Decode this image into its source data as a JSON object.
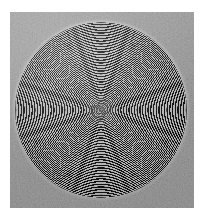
{
  "figure": {
    "kind": "scanned-halftone-plate",
    "caption": "",
    "label": ""
  },
  "canvas": {
    "width_px": 203,
    "height_px": 218,
    "background_color": "#ffffff"
  },
  "plate": {
    "left_px": 10,
    "top_px": 12,
    "width_px": 184,
    "height_px": 196,
    "paper_color": "#9b9b9b",
    "texture": "grain-noise"
  },
  "disc": {
    "center_x_px": 101,
    "center_y_px": 110,
    "radius_x_px": 86,
    "radius_y_px": 88,
    "ring_period_px": 1.58,
    "ring_dark_color": "#121212",
    "ring_light_color": "#b9b9b9",
    "fill_color": "#8e8e8e",
    "rim_highlight_color": "#ffffff",
    "nucleus_type": "spiral"
  },
  "chart_data": {
    "type": "scatter",
    "title": "",
    "subtitle": "",
    "xlabel": "",
    "ylabel": "",
    "grid": false,
    "legend": "none",
    "annotations": [],
    "tick_labels_x": [],
    "tick_labels_y": [],
    "series": [
      {
        "name": "concentric rings",
        "geometry": "circle",
        "center": [
          101,
          110
        ],
        "radii_px": [
          2,
          4,
          5,
          7,
          9,
          10,
          12,
          14,
          15,
          17,
          19,
          20,
          22,
          24,
          25,
          27,
          28,
          30,
          32,
          33,
          35,
          37,
          38,
          40,
          42,
          43,
          45,
          47,
          48,
          50,
          51,
          53,
          55,
          56,
          58,
          60,
          61,
          63,
          65,
          66,
          68,
          70,
          71,
          73,
          74,
          76,
          78,
          79,
          81,
          83,
          84,
          86
        ]
      }
    ]
  }
}
